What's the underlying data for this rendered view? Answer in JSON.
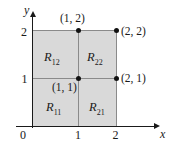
{
  "figure": {
    "type": "math-diagram",
    "background_color": "#ffffff",
    "shaded_color": "#d9d9d9",
    "axis_color": "#1a1a1a",
    "grid_color": "#8a8a8a",
    "dot_color": "#111111"
  },
  "axes": {
    "x_label": "x",
    "y_label": "y",
    "origin_label": "0",
    "x_ticks": [
      "1",
      "2"
    ],
    "y_ticks": [
      "1",
      "2"
    ],
    "x_range": [
      0,
      2
    ],
    "y_range": [
      0,
      2
    ]
  },
  "points": [
    {
      "name": "point-1-2",
      "label": "(1, 2)",
      "x": 1,
      "y": 2
    },
    {
      "name": "point-2-2",
      "label": "(2, 2)",
      "x": 2,
      "y": 2
    },
    {
      "name": "point-1-1",
      "label": "(1, 1)",
      "x": 1,
      "y": 1
    },
    {
      "name": "point-2-1",
      "label": "(2, 1)",
      "x": 2,
      "y": 1
    }
  ],
  "regions": [
    {
      "name": "region-R12",
      "base": "R",
      "sub": "12",
      "x_interval": [
        0,
        1
      ],
      "y_interval": [
        1,
        2
      ]
    },
    {
      "name": "region-R22",
      "base": "R",
      "sub": "22",
      "x_interval": [
        1,
        2
      ],
      "y_interval": [
        1,
        2
      ]
    },
    {
      "name": "region-R11",
      "base": "R",
      "sub": "11",
      "x_interval": [
        0,
        1
      ],
      "y_interval": [
        0,
        1
      ]
    },
    {
      "name": "region-R21",
      "base": "R",
      "sub": "21",
      "x_interval": [
        1,
        2
      ],
      "y_interval": [
        0,
        1
      ]
    }
  ]
}
